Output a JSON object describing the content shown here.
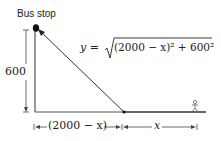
{
  "diagram": {
    "labels": {
      "bus_stop": "Bus stop",
      "height": "600",
      "formula_lhs": "y = ",
      "formula_rad": "(2000 − x)² + 600²",
      "left_dim": "(2000 − x)",
      "right_dim": "x"
    },
    "colors": {
      "line": "#333333",
      "text": "#222222",
      "dot": "#111111",
      "person": "#666666"
    }
  }
}
